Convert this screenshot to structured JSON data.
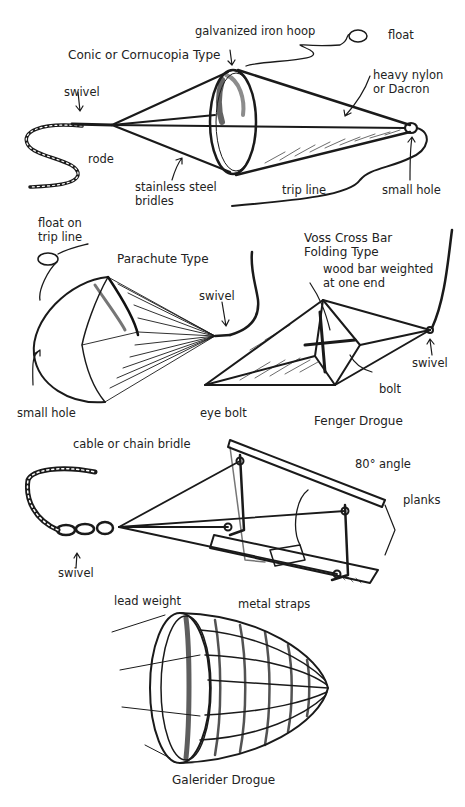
{
  "figure": {
    "sections": [
      {
        "title": "Conic or Cornucopia Type",
        "labels": [
          "galvanized iron hoop",
          "float",
          "heavy nylon or Dacron",
          "swivel",
          "rode",
          "stainless steel bridles",
          "trip line",
          "small hole"
        ]
      },
      {
        "title": "Parachute Type",
        "labels": [
          "float on trip line",
          "swivel",
          "small hole"
        ]
      },
      {
        "title": "Voss Cross Bar Folding Type",
        "labels": [
          "wood bar weighted at one end",
          "swivel",
          "bolt"
        ]
      },
      {
        "title": "Fenger Drogue",
        "labels": [
          "eye bolt",
          "cable or chain bridle",
          "80° angle",
          "planks",
          "swivel",
          "lead weight",
          "metal straps"
        ]
      },
      {
        "title": "Galerider Drogue",
        "labels": []
      }
    ]
  },
  "conic": {
    "title": "Conic or Cornucopia Type",
    "hoop": "galvanized iron hoop",
    "float": "float",
    "fabric_line1": "heavy nylon",
    "fabric_line2": "or Dacron",
    "swivel": "swivel",
    "rode": "rode",
    "bridles_line1": "stainless steel",
    "bridles_line2": "bridles",
    "trip_line": "trip line",
    "small_hole": "small hole"
  },
  "parachute": {
    "title": "Parachute Type",
    "float_line1": "float on",
    "float_line2": "trip line",
    "swivel": "swivel",
    "small_hole": "small hole"
  },
  "voss": {
    "title_line1": "Voss Cross Bar",
    "title_line2": "Folding Type",
    "bar_line1": "wood bar weighted",
    "bar_line2": "at one end",
    "swivel": "swivel",
    "bolt": "bolt"
  },
  "fenger": {
    "title": "Fenger  Drogue",
    "eye_bolt": "eye bolt",
    "bridle": "cable or chain bridle",
    "angle": "80° angle",
    "planks": "planks",
    "swivel": "swivel",
    "lead_weight": "lead weight",
    "metal_straps": "metal straps"
  },
  "galerider": {
    "title": "Galerider Drogue"
  }
}
